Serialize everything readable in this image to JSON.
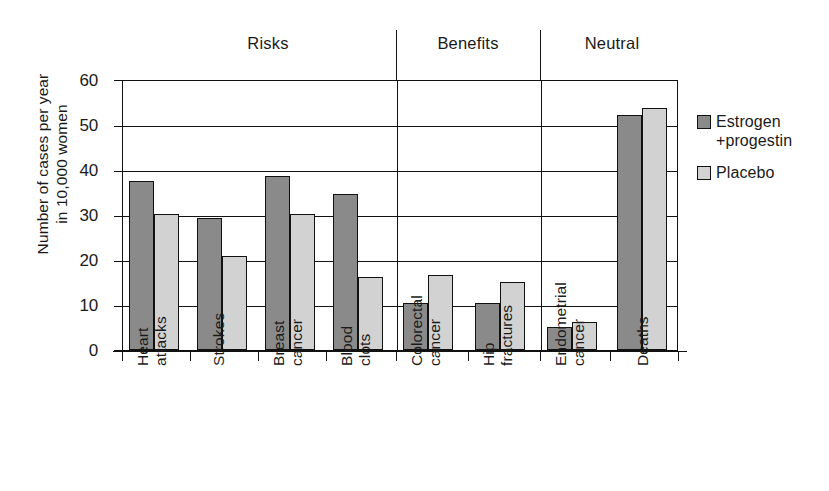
{
  "chart_data": {
    "type": "bar",
    "title": "",
    "xlabel": "",
    "ylabel": "Number of cases per year\nin 10,000 women",
    "ylim": [
      0,
      60
    ],
    "y_ticks": [
      0,
      10,
      20,
      30,
      40,
      50,
      60
    ],
    "grid": true,
    "legend_position": "right",
    "categories": [
      "Heart\nattacks",
      "Strokes",
      "Breast\ncancer",
      "Blood\nclots",
      "Colorectal\ncancer",
      "Hip\nfractures",
      "Endometrial\ncancer",
      "Deaths"
    ],
    "series": [
      {
        "name": "Estrogen\n+progestin",
        "color": "#8a8a8a",
        "values": [
          37.5,
          29.2,
          38.5,
          34.5,
          10.5,
          10.5,
          5.2,
          52.0
        ]
      },
      {
        "name": "Placebo",
        "color": "#d2d2d2",
        "values": [
          30.2,
          20.8,
          30.2,
          16.2,
          16.5,
          15.0,
          6.2,
          53.5
        ]
      }
    ],
    "groups": [
      {
        "label": "Risks",
        "categories": [
          "Heart attacks",
          "Strokes",
          "Breast cancer",
          "Blood clots"
        ]
      },
      {
        "label": "Benefits",
        "categories": [
          "Colorectal cancer",
          "Hip fractures"
        ]
      },
      {
        "label": "Neutral",
        "categories": [
          "Endometrial cancer",
          "Deaths"
        ]
      }
    ]
  },
  "legend": {
    "entries": [
      {
        "label": "Estrogen\n+progestin"
      },
      {
        "label": "Placebo"
      }
    ]
  },
  "axis": {
    "y_title": "Number of cases per year\nin 10,000 women",
    "ticks": [
      "60",
      "50",
      "40",
      "30",
      "20",
      "10",
      "0"
    ]
  },
  "group_headers": [
    "Risks",
    "Benefits",
    "Neutral"
  ]
}
